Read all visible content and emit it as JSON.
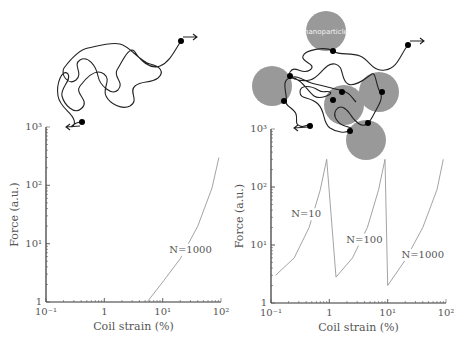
{
  "figure": {
    "left_panel": {
      "illustration": "free-polymer-coil",
      "end_arrows": 2
    },
    "right_panel": {
      "illustration": "polymer-coil-with-nanoparticles",
      "nanoparticle_label": "nanoparticle",
      "nanoparticle_color": "#999999",
      "nanoparticle_count": 5
    }
  },
  "chart_data": [
    {
      "type": "line",
      "title": "",
      "xlabel": "Coil strain (%)",
      "ylabel": "Force (a.u.)",
      "xscale": "log",
      "yscale": "log",
      "xlim": [
        0.1,
        100
      ],
      "ylim": [
        1,
        1000
      ],
      "xticks": [
        "10⁻¹",
        "1",
        "10¹",
        "10²"
      ],
      "yticks": [
        "1",
        "10¹",
        "10²",
        "10³"
      ],
      "grid": false,
      "series": [
        {
          "name": "N=1000",
          "x": [
            5.4,
            10,
            20,
            40,
            70,
            92
          ],
          "y": [
            1,
            2.2,
            5.5,
            20,
            90,
            300
          ]
        }
      ],
      "annotations": [
        {
          "text": "N=1000",
          "x": 30,
          "y": 7
        }
      ]
    },
    {
      "type": "line",
      "title": "",
      "xlabel": "Coil strain (%)",
      "ylabel": "Force (a.u.)",
      "xscale": "log",
      "yscale": "log",
      "xlim": [
        0.1,
        100
      ],
      "ylim": [
        1,
        1000
      ],
      "xticks": [
        "10⁻¹",
        "1",
        "10¹",
        "10²"
      ],
      "yticks": [
        "1",
        "10¹",
        "10²",
        "10³"
      ],
      "grid": false,
      "series": [
        {
          "name": "N=10",
          "x": [
            0.12,
            0.25,
            0.45,
            0.7,
            0.9,
            1.3
          ],
          "y": [
            3,
            6,
            20,
            90,
            300,
            2.8
          ]
        },
        {
          "name": "N=100",
          "x": [
            1.3,
            2.5,
            4.5,
            7,
            9,
            10
          ],
          "y": [
            2.8,
            6,
            20,
            90,
            300,
            2
          ]
        },
        {
          "name": "N=1000",
          "x": [
            10,
            20,
            40,
            70,
            90
          ],
          "y": [
            2,
            5.5,
            20,
            90,
            300
          ]
        }
      ],
      "annotations": [
        {
          "text": "N=10",
          "x": 0.4,
          "y": 30
        },
        {
          "text": "N=100",
          "x": 4,
          "y": 11
        },
        {
          "text": "N=1000",
          "x": 40,
          "y": 6
        }
      ]
    }
  ]
}
